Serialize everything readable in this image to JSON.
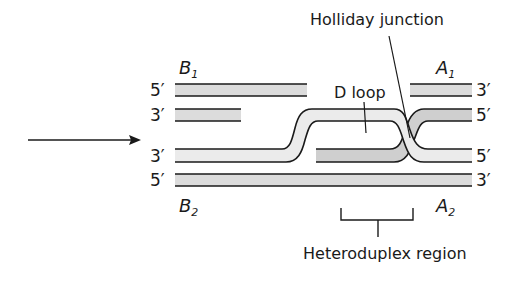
{
  "diagram": {
    "type": "homologous-recombination-strand-invasion",
    "colors": {
      "strand_fill": "#dcdcdc",
      "strand_outline": "#1a1a1a",
      "text": "#1a1a1a",
      "background": "#ffffff"
    },
    "labels": {
      "holliday_junction": "Holliday junction",
      "d_loop": "D loop",
      "heteroduplex_region": "Heteroduplex region",
      "b1": {
        "main": "B",
        "sub": "1"
      },
      "b2": {
        "main": "B",
        "sub": "2"
      },
      "a1": {
        "main": "A",
        "sub": "1"
      },
      "a2": {
        "main": "A",
        "sub": "2"
      }
    },
    "strand_ends": {
      "left": [
        "5′",
        "3′",
        "3′",
        "5′"
      ],
      "right": [
        "3′",
        "5′",
        "5′",
        "3′"
      ]
    },
    "arrow": {
      "direction": "right",
      "meaning": "points-to-invading-strand"
    }
  }
}
